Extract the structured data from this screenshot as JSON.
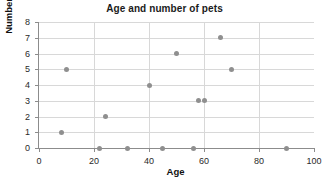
{
  "chart_data": {
    "type": "scatter",
    "title": "Age and number of pets",
    "xlabel": "Age",
    "ylabel": "Number of pets",
    "xlim": [
      0,
      100
    ],
    "ylim": [
      0,
      8
    ],
    "xticks": [
      0,
      20,
      40,
      60,
      80,
      100
    ],
    "yticks": [
      0,
      1,
      2,
      3,
      4,
      5,
      6,
      7,
      8
    ],
    "grid": true,
    "legend": null,
    "point_color": "#8f8f8f",
    "gridline_color": "#d8d8d8",
    "axis_color": "#8c8c8c",
    "points": [
      {
        "x": 8,
        "y": 1
      },
      {
        "x": 10,
        "y": 5
      },
      {
        "x": 22,
        "y": 0
      },
      {
        "x": 24,
        "y": 2
      },
      {
        "x": 32,
        "y": 0
      },
      {
        "x": 40,
        "y": 4
      },
      {
        "x": 45,
        "y": 0
      },
      {
        "x": 50,
        "y": 6
      },
      {
        "x": 56,
        "y": 0
      },
      {
        "x": 58,
        "y": 3
      },
      {
        "x": 60,
        "y": 3
      },
      {
        "x": 66,
        "y": 7
      },
      {
        "x": 70,
        "y": 5
      },
      {
        "x": 90,
        "y": 0
      }
    ]
  }
}
